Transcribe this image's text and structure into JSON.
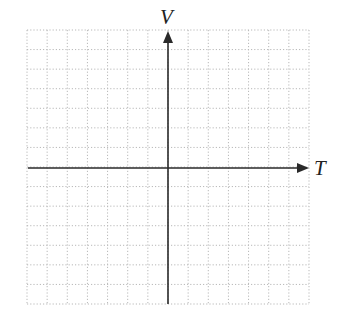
{
  "chart_data": {
    "type": "line",
    "title": "",
    "xlabel": "T",
    "ylabel": "V",
    "series": [],
    "grid": true,
    "grid_columns": 14,
    "grid_rows": 14,
    "x_ticks": [],
    "y_ticks": [],
    "note": "Blank coordinate grid with T (horizontal) and V (vertical) axes crossing at center; no data plotted"
  },
  "axes": {
    "x_label": "T",
    "y_label": "V"
  },
  "colors": {
    "grid": "#b8b8b8",
    "axis": "#2a2a2a"
  }
}
